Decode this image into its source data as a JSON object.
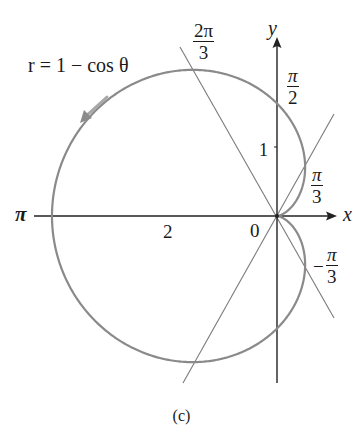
{
  "figure": {
    "equation": "r = 1 − cos θ",
    "caption": "(c)",
    "axis_labels": {
      "x": "x",
      "y": "y"
    },
    "origin_label": "0",
    "tick_labels": {
      "x_tick": "2",
      "y_tick": "1"
    },
    "angle_labels": {
      "pi": "π",
      "two_pi_over_3": {
        "num": "2π",
        "den": "3"
      },
      "pi_over_2": {
        "num": "π",
        "den": "2"
      },
      "pi_over_3": {
        "num": "π",
        "den": "3"
      },
      "neg_pi_over_3": {
        "sign": "−",
        "num": "π",
        "den": "3"
      }
    },
    "colors": {
      "curve": "#808080",
      "axes": "#222222",
      "lines": "#7a7a7a",
      "text": "#1a1a1a"
    }
  },
  "chart_data": {
    "type": "polar-curve",
    "title": "r = 1 − cos θ",
    "equation": "r = 1 - cos(theta)",
    "theta_range": [
      0,
      6.2832
    ],
    "curve_name": "cardioid",
    "points_polar": [
      {
        "theta": "0",
        "r": 0
      },
      {
        "theta": "π/3",
        "r": 0.5
      },
      {
        "theta": "π/2",
        "r": 1
      },
      {
        "theta": "2π/3",
        "r": 1.5
      },
      {
        "theta": "π",
        "r": 2
      },
      {
        "theta": "4π/3",
        "r": 1.5
      },
      {
        "theta": "3π/2",
        "r": 1
      },
      {
        "theta": "5π/3",
        "r": 0.5
      }
    ],
    "reference_lines_theta": [
      "π/3",
      "2π/3"
    ],
    "xlabel": "x",
    "ylabel": "y",
    "x_ticks": [
      {
        "value": -2,
        "label": "2"
      }
    ],
    "y_ticks": [
      {
        "value": 1,
        "label": "1"
      }
    ],
    "direction_arrow": "counterclockwise (arrow on upper-left arc)",
    "grid": false,
    "caption": "(c)"
  }
}
